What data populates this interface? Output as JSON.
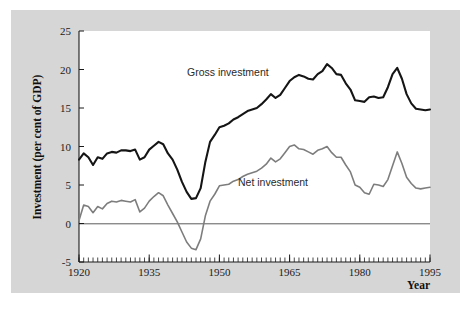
{
  "figure": {
    "background_color": "#d6d6d6",
    "plot_background_color": "#ffffff",
    "outer_background_color": "#ffffff"
  },
  "chart_data": {
    "type": "line",
    "title": "",
    "xlabel": "Year",
    "ylabel": "Investment (per cent of GDP)",
    "xlim": [
      1920,
      1995
    ],
    "ylim": [
      -5,
      25
    ],
    "grid": false,
    "legend_position": "inline-annotations",
    "x_major_ticks": [
      1920,
      1935,
      1950,
      1965,
      1980,
      1995
    ],
    "x_tick_labels": [
      "1920",
      "1935",
      "1950",
      "1965",
      "1980",
      "1995"
    ],
    "x_minor_tick_interval": 1,
    "y_major_ticks": [
      -5,
      0,
      5,
      10,
      15,
      20,
      25
    ],
    "y_tick_labels": [
      "-5",
      "0",
      "5",
      "10",
      "15",
      "20",
      "25"
    ],
    "zero_reference_line": 0,
    "x": [
      1920,
      1921,
      1922,
      1923,
      1924,
      1925,
      1926,
      1927,
      1928,
      1929,
      1930,
      1931,
      1932,
      1933,
      1934,
      1935,
      1936,
      1937,
      1938,
      1939,
      1940,
      1941,
      1942,
      1943,
      1944,
      1945,
      1946,
      1947,
      1948,
      1949,
      1950,
      1951,
      1952,
      1953,
      1954,
      1955,
      1956,
      1957,
      1958,
      1959,
      1960,
      1961,
      1962,
      1963,
      1964,
      1965,
      1966,
      1967,
      1968,
      1969,
      1970,
      1971,
      1972,
      1973,
      1974,
      1975,
      1976,
      1977,
      1978,
      1979,
      1980,
      1981,
      1982,
      1983,
      1984,
      1985,
      1986,
      1987,
      1988,
      1989,
      1990,
      1991,
      1992,
      1993,
      1994,
      1995
    ],
    "series": [
      {
        "name": "Gross investment",
        "color": "#151515",
        "annotation_text": "Gross investment",
        "values": [
          8.3,
          9.1,
          8.6,
          7.6,
          8.6,
          8.4,
          9.1,
          9.3,
          9.2,
          9.5,
          9.5,
          9.4,
          9.6,
          8.3,
          8.6,
          9.6,
          10.1,
          10.6,
          10.3,
          9.1,
          8.3,
          7.0,
          5.4,
          4.1,
          3.2,
          3.3,
          4.6,
          8.0,
          10.6,
          11.5,
          12.5,
          12.7,
          13.0,
          13.5,
          13.8,
          14.2,
          14.6,
          14.8,
          15.0,
          15.5,
          16.1,
          16.8,
          16.3,
          16.7,
          17.6,
          18.5,
          19.0,
          19.3,
          19.1,
          18.8,
          18.7,
          19.4,
          19.8,
          20.7,
          20.2,
          19.4,
          19.3,
          18.2,
          17.4,
          16.0,
          15.9,
          15.8,
          16.4,
          16.5,
          16.3,
          16.4,
          17.7,
          19.4,
          20.2,
          18.8,
          16.8,
          15.6,
          14.9,
          14.8,
          14.7,
          14.8
        ]
      },
      {
        "name": "Net investment",
        "color": "#7d7d7d",
        "annotation_text": "Net investment",
        "values": [
          0.4,
          2.4,
          2.2,
          1.4,
          2.2,
          1.9,
          2.6,
          2.9,
          2.8,
          3.0,
          2.9,
          2.8,
          3.1,
          1.5,
          2.0,
          2.9,
          3.5,
          4.0,
          3.6,
          2.4,
          1.3,
          0.2,
          -1.1,
          -2.4,
          -3.2,
          -3.4,
          -2.0,
          1.0,
          2.9,
          3.8,
          4.9,
          5.0,
          5.1,
          5.5,
          5.7,
          6.1,
          6.4,
          6.6,
          6.8,
          7.2,
          7.7,
          8.5,
          8.0,
          8.4,
          9.2,
          10.0,
          10.2,
          9.7,
          9.6,
          9.3,
          9.0,
          9.5,
          9.7,
          10.0,
          9.2,
          8.6,
          8.6,
          7.6,
          6.7,
          5.0,
          4.7,
          4.0,
          3.8,
          5.1,
          5.0,
          4.8,
          5.7,
          7.5,
          9.3,
          7.8,
          6.0,
          5.2,
          4.6,
          4.5,
          4.6,
          4.7
        ]
      }
    ]
  }
}
